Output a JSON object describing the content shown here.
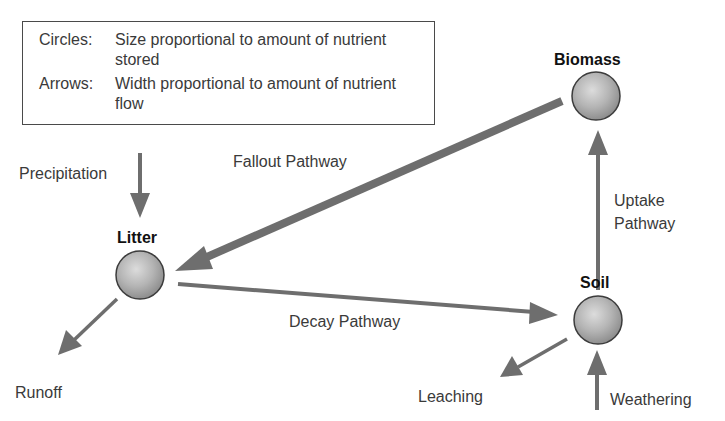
{
  "legend": {
    "circles_key": "Circles:",
    "circles_desc": "Size proportional to amount of nutrient stored",
    "arrows_key": "Arrows:",
    "arrows_desc": "Width proportional to amount of nutrient flow"
  },
  "nodes": {
    "biomass": {
      "label": "Biomass"
    },
    "litter": {
      "label": "Litter"
    },
    "soil": {
      "label": "Soil"
    }
  },
  "flows": {
    "precipitation": "Precipitation",
    "fallout": "Fallout Pathway",
    "uptake_line1": "Uptake",
    "uptake_line2": "Pathway",
    "decay": "Decay Pathway",
    "runoff": "Runoff",
    "leaching": "Leaching",
    "weathering": "Weathering"
  },
  "colors": {
    "arrow": "#6e6e6e",
    "circle_fill_light": "#d9d9d9",
    "circle_fill_dark": "#8f8f8f",
    "circle_stroke": "#3c3c3c",
    "legend_border": "#4a4a4a",
    "text": "#3a3a3a"
  }
}
